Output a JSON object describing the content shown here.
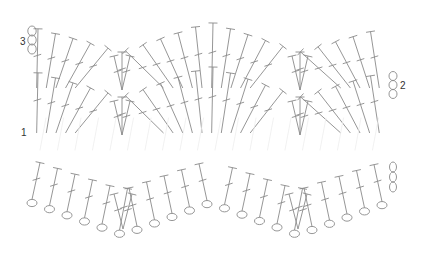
{
  "diagram": {
    "type": "crochet-chart",
    "pattern": "ripple / chevron",
    "stitch_color": "#8a8a8a",
    "faint_color": "#eeeeee",
    "row_labels": [
      {
        "label": "1",
        "x": 21,
        "y": 127
      },
      {
        "label": "2",
        "x": 399,
        "y": 80
      },
      {
        "label": "3",
        "x": 20,
        "y": 35
      }
    ],
    "legend": {
      "chain_oval": "chain stitch",
      "t_stitch_with_bar": "double crochet"
    },
    "rows": [
      {
        "name": "row-3",
        "y_top_peak": 22,
        "y_top_valley": 52,
        "y_bottom_point": 85
      },
      {
        "name": "row-2",
        "y_top_peak": 66,
        "y_top_valley": 97,
        "y_bottom_point": 130
      },
      {
        "name": "row-1",
        "y_top_peak": 160,
        "y_top_valley": 190,
        "faint": true
      },
      {
        "name": "foundation",
        "y_chain": 200
      }
    ]
  }
}
